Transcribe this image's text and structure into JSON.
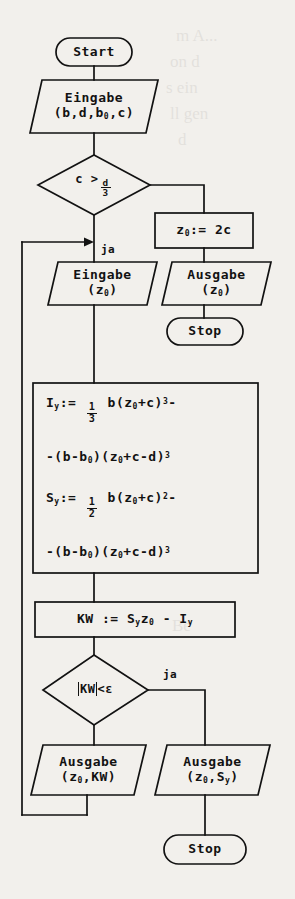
{
  "figure": {
    "kind": "flowchart",
    "language": "de",
    "medium": "scanned-book-page",
    "paper_color": "#f2f0ec",
    "ink_color": "#121212"
  },
  "ghost_text": [
    "m A...",
    "on d",
    "s ein",
    "ll gen",
    "d",
    "Be"
  ],
  "nodes": {
    "start_top": {
      "shape": "terminator",
      "label": "Start"
    },
    "input_params": {
      "shape": "parallelogram",
      "line1": "Eingabe",
      "line2_pre": "(b,d,b",
      "line2_sub": "0",
      "line2_post": ",c)"
    },
    "decision_c": {
      "shape": "diamond",
      "lhs": "c",
      "op": ">",
      "num": "d",
      "den": "3"
    },
    "assign_z0": {
      "shape": "process",
      "pre": "z",
      "sub": "0",
      "op": ":=",
      "rhs": "2c"
    },
    "input_z0": {
      "shape": "parallelogram",
      "line1": "Eingabe",
      "line2_pre": "(z",
      "line2_sub": "0",
      "line2_post": ")"
    },
    "output_z0": {
      "shape": "parallelogram",
      "line1": "Ausgabe",
      "line2_pre": "(z",
      "line2_sub": "0",
      "line2_post": ")"
    },
    "stop_right_top": {
      "shape": "terminator",
      "label": "Stop"
    },
    "formula_box": {
      "shape": "process",
      "rows": [
        {
          "lead": "I",
          "lead_sub": "y",
          "op": ":=",
          "frac_num": "1",
          "frac_den": "3",
          "body_pre": "b(z",
          "body_sub": "0",
          "body_post": "+c)",
          "power": "3",
          "trail": "-"
        },
        {
          "text_pre": "-(b-b",
          "text_sub": "0",
          "text_mid": ")(z",
          "text_sub2": "0",
          "text_post": "+c-d)",
          "power": "3"
        },
        {
          "lead": "S",
          "lead_sub": "y",
          "op": ":=",
          "frac_num": "1",
          "frac_den": "2",
          "body_pre": "b(z",
          "body_sub": "0",
          "body_post": "+c)",
          "power": "2",
          "trail": "-"
        },
        {
          "text_pre": "-(b-b",
          "text_sub": "0",
          "text_mid": ")(z",
          "text_sub2": "0",
          "text_post": "+c-d)",
          "power": "3"
        }
      ]
    },
    "assign_kw": {
      "shape": "process",
      "lhs": "KW",
      "op": ":=",
      "t1": "S",
      "t1_sub": "y",
      "t2": "z",
      "t2_sub": "0",
      "minus": "-",
      "t3": "I",
      "t3_sub": "y"
    },
    "decision_kw": {
      "shape": "diamond",
      "abs": "KW",
      "op": "<",
      "eps": "ε"
    },
    "output_kw": {
      "shape": "parallelogram",
      "line1": "Ausgabe",
      "line2_pre": "(z",
      "line2_sub": "0",
      "line2_post": ",KW)"
    },
    "output_sy": {
      "shape": "parallelogram",
      "line1": "Ausgabe",
      "line2_pre": "(z",
      "line2_sub": "0",
      "line2_post": ",S",
      "line2_sub2": "y",
      "line2_tail": ")"
    },
    "stop_bottom": {
      "shape": "terminator",
      "label": "Stop"
    }
  },
  "edge_labels": {
    "ja_top": "ja",
    "ja_bottom": "ja"
  }
}
